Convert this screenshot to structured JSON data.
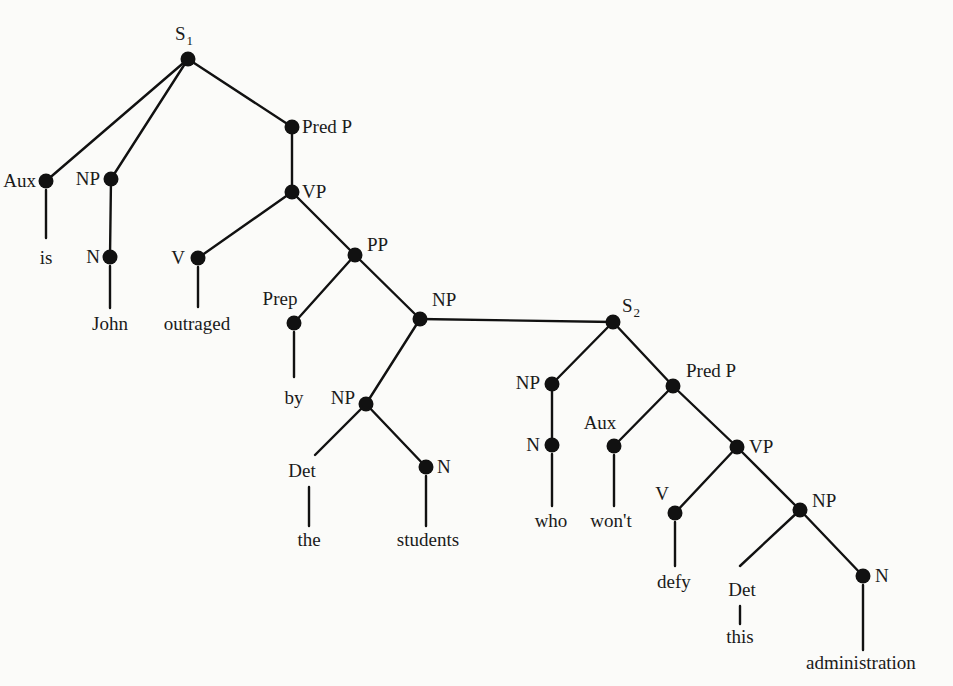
{
  "diagram": {
    "type": "syntax-tree",
    "sentence": "John is outraged by the students who won't defy this administration",
    "nodes": [
      {
        "id": "S1",
        "label": "S",
        "sub": "1",
        "x": 188,
        "y": 59,
        "dot": true,
        "lx": 175,
        "ly": 40,
        "anchor": "start"
      },
      {
        "id": "Aux1",
        "label": "Aux",
        "x": 46,
        "y": 181,
        "dot": true,
        "lx": 36,
        "ly": 187,
        "anchor": "end"
      },
      {
        "id": "NP1",
        "label": "NP",
        "x": 111,
        "y": 179,
        "dot": true,
        "lx": 100,
        "ly": 185,
        "anchor": "end"
      },
      {
        "id": "PredP1",
        "label": "Pred P",
        "x": 292,
        "y": 127,
        "dot": true,
        "lx": 302,
        "ly": 133,
        "anchor": "start"
      },
      {
        "id": "N1",
        "label": "N",
        "x": 110,
        "y": 257,
        "dot": true,
        "lx": 100,
        "ly": 263,
        "anchor": "end"
      },
      {
        "id": "VP1",
        "label": "VP",
        "x": 292,
        "y": 192,
        "dot": true,
        "lx": 302,
        "ly": 198,
        "anchor": "start"
      },
      {
        "id": "V1",
        "label": "V",
        "x": 198,
        "y": 258,
        "dot": true,
        "lx": 185,
        "ly": 264,
        "anchor": "end"
      },
      {
        "id": "PP1",
        "label": "PP",
        "x": 355,
        "y": 255,
        "dot": true,
        "lx": 367,
        "ly": 251,
        "anchor": "start"
      },
      {
        "id": "Prep1",
        "label": "Prep",
        "x": 294,
        "y": 323,
        "dot": true,
        "lx": 280,
        "ly": 305,
        "anchor": "middle"
      },
      {
        "id": "NP2",
        "label": "NP",
        "x": 420,
        "y": 319,
        "dot": true,
        "lx": 432,
        "ly": 306,
        "anchor": "start"
      },
      {
        "id": "NP3",
        "label": "NP",
        "x": 366,
        "y": 404,
        "dot": true,
        "lx": 355,
        "ly": 404,
        "anchor": "end"
      },
      {
        "id": "Det1",
        "label": "Det",
        "x": 315,
        "y": 455,
        "dot": false,
        "lx": 302,
        "ly": 477,
        "anchor": "middle"
      },
      {
        "id": "N2",
        "label": "N",
        "x": 426,
        "y": 467,
        "dot": true,
        "lx": 437,
        "ly": 473,
        "anchor": "start"
      },
      {
        "id": "S2",
        "label": "S",
        "sub": "2",
        "x": 613,
        "y": 322,
        "dot": true,
        "lx": 622,
        "ly": 312,
        "anchor": "start"
      },
      {
        "id": "NP4",
        "label": "NP",
        "x": 552,
        "y": 384,
        "dot": true,
        "lx": 540,
        "ly": 389,
        "anchor": "end"
      },
      {
        "id": "PredP2",
        "label": "Pred P",
        "x": 673,
        "y": 386,
        "dot": true,
        "lx": 686,
        "ly": 377,
        "anchor": "start"
      },
      {
        "id": "N3",
        "label": "N",
        "x": 552,
        "y": 445,
        "dot": true,
        "lx": 540,
        "ly": 451,
        "anchor": "end"
      },
      {
        "id": "Aux2",
        "label": "Aux",
        "x": 614,
        "y": 446,
        "dot": true,
        "lx": 600,
        "ly": 429,
        "anchor": "middle"
      },
      {
        "id": "VP2",
        "label": "VP",
        "x": 737,
        "y": 447,
        "dot": true,
        "lx": 749,
        "ly": 453,
        "anchor": "start"
      },
      {
        "id": "V2",
        "label": "V",
        "x": 675,
        "y": 513,
        "dot": true,
        "lx": 662,
        "ly": 500,
        "anchor": "middle"
      },
      {
        "id": "NP5",
        "label": "NP",
        "x": 800,
        "y": 510,
        "dot": true,
        "lx": 812,
        "ly": 507,
        "anchor": "start"
      },
      {
        "id": "Det2",
        "label": "Det",
        "x": 740,
        "y": 566,
        "dot": false,
        "lx": 742,
        "ly": 596,
        "anchor": "middle"
      },
      {
        "id": "N4",
        "label": "N",
        "x": 863,
        "y": 576,
        "dot": true,
        "lx": 875,
        "ly": 582,
        "anchor": "start"
      }
    ],
    "words": [
      {
        "text": "is",
        "x": 46,
        "y": 264,
        "parent": "Aux1",
        "line_top": 190,
        "line_bottom": 238
      },
      {
        "text": "John",
        "x": 110,
        "y": 330,
        "parent": "N1",
        "line_top": 266,
        "line_bottom": 308
      },
      {
        "text": "outraged",
        "x": 197,
        "y": 330,
        "parent": "V1",
        "line_top": 267,
        "line_bottom": 307
      },
      {
        "text": "by",
        "x": 294,
        "y": 404,
        "parent": "Prep1",
        "line_top": 332,
        "line_bottom": 377
      },
      {
        "text": "the",
        "x": 309,
        "y": 546,
        "parent": "Det1",
        "line_top": 487,
        "line_bottom": 526
      },
      {
        "text": "students",
        "x": 428,
        "y": 546,
        "parent": "N2",
        "line_top": 476,
        "line_bottom": 526
      },
      {
        "text": "who",
        "x": 551,
        "y": 527,
        "parent": "N3",
        "line_top": 454,
        "line_bottom": 506
      },
      {
        "text": "won't",
        "x": 611,
        "y": 527,
        "parent": "Aux2",
        "line_top": 455,
        "line_bottom": 506
      },
      {
        "text": "defy",
        "x": 674,
        "y": 588,
        "parent": "V2",
        "line_top": 522,
        "line_bottom": 566
      },
      {
        "text": "this",
        "x": 740,
        "y": 643,
        "parent": "Det2",
        "line_top": 606,
        "line_bottom": 624
      },
      {
        "text": "administration",
        "x": 861,
        "y": 669,
        "parent": "N4",
        "line_top": 585,
        "line_bottom": 650
      }
    ],
    "edges": [
      [
        "S1",
        "Aux1"
      ],
      [
        "S1",
        "NP1"
      ],
      [
        "S1",
        "PredP1"
      ],
      [
        "NP1",
        "N1"
      ],
      [
        "PredP1",
        "VP1"
      ],
      [
        "VP1",
        "V1"
      ],
      [
        "VP1",
        "PP1"
      ],
      [
        "PP1",
        "Prep1"
      ],
      [
        "PP1",
        "NP2"
      ],
      [
        "NP2",
        "NP3"
      ],
      [
        "NP2",
        "S2"
      ],
      [
        "NP3",
        "Det1"
      ],
      [
        "NP3",
        "N2"
      ],
      [
        "S2",
        "NP4"
      ],
      [
        "S2",
        "PredP2"
      ],
      [
        "NP4",
        "N3"
      ],
      [
        "PredP2",
        "Aux2"
      ],
      [
        "PredP2",
        "VP2"
      ],
      [
        "VP2",
        "V2"
      ],
      [
        "VP2",
        "NP5"
      ],
      [
        "NP5",
        "Det2"
      ],
      [
        "NP5",
        "N4"
      ]
    ]
  }
}
